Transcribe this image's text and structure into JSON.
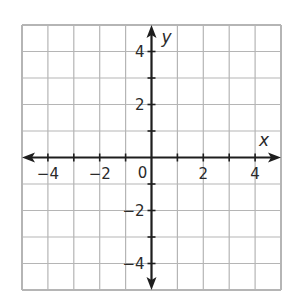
{
  "chart_data": {
    "type": "coordinate-grid",
    "title": "",
    "xlabel": "x",
    "ylabel": "y",
    "xlim": [
      -5,
      5
    ],
    "ylim": [
      -5,
      5
    ],
    "grid": true,
    "grid_step": 1,
    "x_ticks": [
      -4,
      -2,
      0,
      2,
      4
    ],
    "y_ticks": [
      -4,
      -2,
      2,
      4
    ],
    "x_tick_labels": [
      "−4",
      "−2",
      "0",
      "2",
      "4"
    ],
    "y_tick_labels": [
      "−4",
      "−2",
      "2",
      "4"
    ],
    "origin_label": "0",
    "series": [],
    "legend": null
  },
  "colors": {
    "grid": "#b5b5b5",
    "axis": "#1e1e1e",
    "text": "#2a2a2a",
    "background": "#ffffff"
  },
  "layout": {
    "left": 22,
    "top": 25,
    "cell_w": 25.9,
    "cell_h": 26.5,
    "cols": 10,
    "rows": 10
  }
}
